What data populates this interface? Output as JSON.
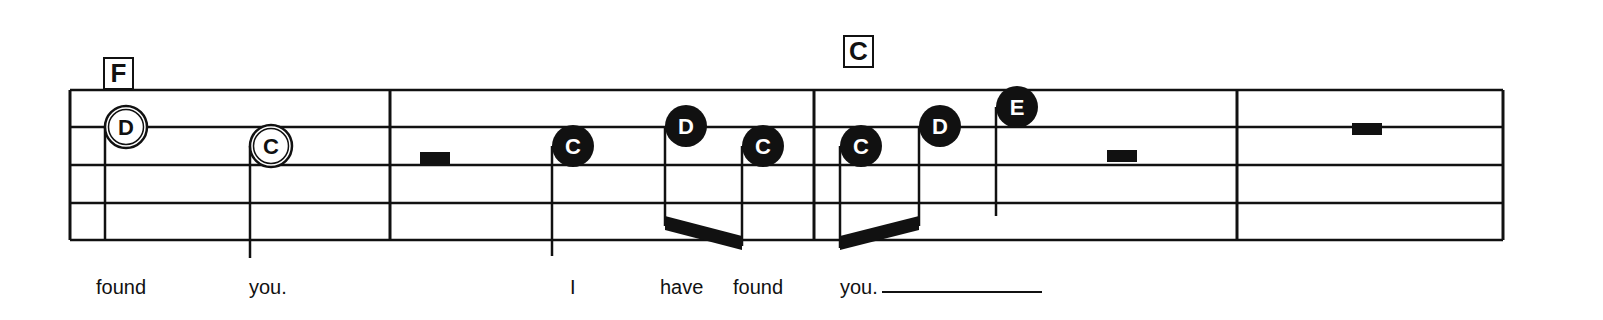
{
  "chords": [
    {
      "label": "F",
      "x": 103,
      "y": 57
    },
    {
      "label": "C",
      "x": 843,
      "y": 35
    }
  ],
  "staff": {
    "left": 70,
    "right": 1503,
    "lines_y": [
      90,
      127,
      165,
      203,
      240
    ],
    "barlines_x": [
      70,
      390,
      814,
      1237,
      1503
    ],
    "colors": {
      "ink": "#111111",
      "paper": "#ffffff"
    }
  },
  "notes": [
    {
      "letter": "D",
      "x": 126,
      "y": 127,
      "style": "hollow",
      "stem_x": 105,
      "stem_bottom": 240
    },
    {
      "letter": "C",
      "x": 271,
      "y": 146,
      "style": "hollow",
      "stem_x": 250,
      "stem_bottom": 258
    },
    {
      "letter": "C",
      "x": 573,
      "y": 146,
      "style": "filled",
      "stem_x": 552,
      "stem_bottom": 256
    },
    {
      "letter": "D",
      "x": 686,
      "y": 126,
      "style": "filled",
      "stem_x": 665,
      "stem_bottom": 226
    },
    {
      "letter": "C",
      "x": 763,
      "y": 146,
      "style": "filled",
      "stem_x": 742,
      "stem_bottom": 246
    },
    {
      "letter": "C",
      "x": 861,
      "y": 146,
      "style": "filled",
      "stem_x": 840,
      "stem_bottom": 248
    },
    {
      "letter": "D",
      "x": 940,
      "y": 126,
      "style": "filled",
      "stem_x": 919,
      "stem_bottom": 226
    },
    {
      "letter": "E",
      "x": 1017,
      "y": 107,
      "style": "filled",
      "stem_x": 996,
      "stem_bottom": 216
    }
  ],
  "beams": [
    {
      "x1": 665,
      "y1": 228,
      "x2": 742,
      "y2": 248
    },
    {
      "x1": 840,
      "y1": 248,
      "x2": 919,
      "y2": 228
    }
  ],
  "rests": [
    {
      "type": "half",
      "x": 420,
      "y": 152,
      "w": 30,
      "h": 13
    },
    {
      "type": "half",
      "x": 1107,
      "y": 150,
      "w": 30,
      "h": 12
    },
    {
      "type": "whole",
      "x": 1352,
      "y": 123,
      "w": 30,
      "h": 12
    }
  ],
  "lyrics": [
    {
      "text": "found",
      "x": 96
    },
    {
      "text": "you.",
      "x": 249
    },
    {
      "text": "I",
      "x": 570
    },
    {
      "text": "have",
      "x": 660
    },
    {
      "text": "found",
      "x": 733
    },
    {
      "text": "you.",
      "x": 840
    }
  ],
  "lyric_extender": {
    "x": 882,
    "width": 160
  }
}
